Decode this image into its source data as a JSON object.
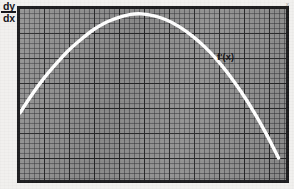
{
  "figure": {
    "background_color": "#f1f0ee",
    "plot_background_color": "#8f8f8f",
    "border_color": "#1b1b1d",
    "curve_color": "#ffffff",
    "grid": "on",
    "minor_grid_px": 5,
    "major_grid_px": 25
  },
  "labels": {
    "y_axis_numerator": "dy",
    "y_axis_denominator": "dx",
    "curve_label": "f'(x)",
    "corner_artifact": "x"
  },
  "chart_data": {
    "type": "line",
    "title": "",
    "subtitle": "",
    "xlabel": "",
    "ylabel": "dy/dx",
    "grid": true,
    "legend_position": "inline-annotation",
    "annotations": [
      {
        "text": "f'(x)",
        "x": 8.05,
        "y": 3.75
      },
      {
        "text": "dy/dx",
        "x": -0.7,
        "y": 7.2
      }
    ],
    "xlim": [
      0,
      10.7
    ],
    "ylim": [
      0,
      7.0
    ],
    "xticks": [
      0,
      1,
      2,
      3,
      4,
      5,
      6,
      7,
      8,
      9,
      10
    ],
    "yticks": [
      0,
      1,
      2,
      3,
      4,
      5,
      6,
      7
    ],
    "series": [
      {
        "name": "f'(x)",
        "color": "#ffffff",
        "x": [
          0.0,
          0.45,
          0.95,
          1.45,
          1.95,
          2.45,
          2.95,
          3.45,
          3.95,
          4.45,
          4.9,
          5.4,
          5.9,
          6.4,
          6.9,
          7.4,
          7.9,
          8.4,
          8.9,
          9.4,
          9.9,
          10.4
        ],
        "y": [
          2.75,
          3.45,
          4.15,
          4.75,
          5.3,
          5.75,
          6.15,
          6.45,
          6.65,
          6.78,
          6.8,
          6.72,
          6.55,
          6.28,
          5.92,
          5.48,
          4.95,
          4.32,
          3.6,
          2.8,
          1.9,
          0.9
        ]
      }
    ]
  }
}
